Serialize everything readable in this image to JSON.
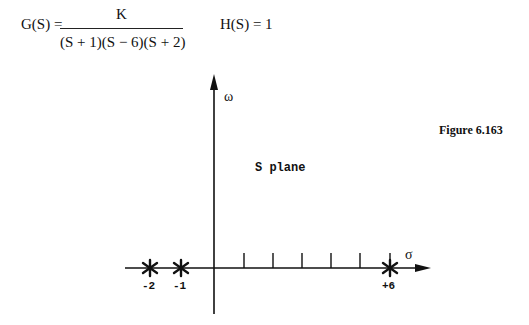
{
  "equations": {
    "g_label": "G(S) =",
    "g_numerator": "K",
    "g_denominator": "(S + 1)(S − 6)(S + 2)",
    "h": "H(S) = 1"
  },
  "figure": {
    "caption": "Figure 6.163",
    "plane_label": "S plane",
    "x_axis_label": "σ",
    "y_axis_label": "ω",
    "poles": [
      {
        "value": -2,
        "label": "-2"
      },
      {
        "value": -1,
        "label": "-1"
      },
      {
        "value": 6,
        "label": "+6"
      }
    ],
    "tick_positions": [
      1,
      2,
      3,
      4,
      5,
      6
    ]
  }
}
